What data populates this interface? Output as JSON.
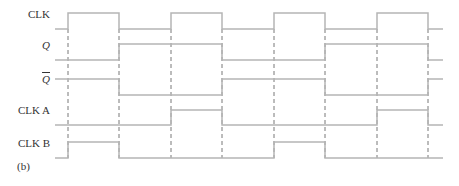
{
  "figure": {
    "caption": "(b)",
    "line_color": "#b5b5b5",
    "dash_color": "#555555"
  },
  "signals": [
    {
      "name": "CLK",
      "italic": false,
      "overbar": false,
      "label_y": 15,
      "high_y": 13,
      "low_y": 29,
      "levels": [
        "L",
        "H",
        "L",
        "H",
        "L",
        "H",
        "L",
        "H",
        "L"
      ]
    },
    {
      "name": "Q",
      "italic": true,
      "overbar": false,
      "label_y": 46,
      "high_y": 44,
      "low_y": 60,
      "levels": [
        "L",
        "L",
        "H",
        "H",
        "L",
        "L",
        "H",
        "H",
        "L"
      ]
    },
    {
      "name": "Q",
      "italic": true,
      "overbar": true,
      "label_y": 80,
      "high_y": 79,
      "low_y": 95,
      "levels": [
        "H",
        "H",
        "L",
        "L",
        "H",
        "H",
        "L",
        "L",
        "H"
      ]
    },
    {
      "name": "CLK A",
      "italic": false,
      "overbar": false,
      "label_y": 111,
      "high_y": 110,
      "low_y": 125,
      "levels": [
        "L",
        "L",
        "L",
        "H",
        "L",
        "L",
        "L",
        "H",
        "L"
      ]
    },
    {
      "name": "CLK B",
      "italic": false,
      "overbar": false,
      "label_y": 144,
      "high_y": 142,
      "low_y": 158,
      "levels": [
        "L",
        "H",
        "L",
        "L",
        "L",
        "H",
        "L",
        "L",
        "L"
      ]
    }
  ],
  "timing": {
    "start_x": 55,
    "end_x": 443,
    "edges_x": [
      68,
      119,
      171,
      222,
      274,
      325,
      377,
      428
    ],
    "dash_top": 29,
    "dash_bottom": 158
  }
}
